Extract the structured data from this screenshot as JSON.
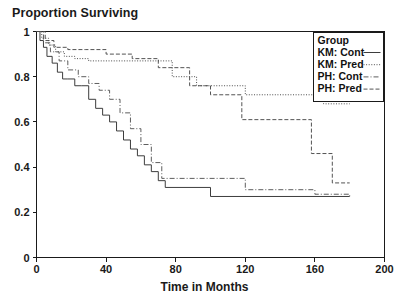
{
  "chart_data": {
    "type": "line",
    "title": "Proportion Surviving",
    "xlabel": "Time in Months",
    "ylabel": "",
    "xlim": [
      0,
      200
    ],
    "ylim": [
      0,
      1
    ],
    "xticks": [
      0,
      40,
      80,
      120,
      160,
      200
    ],
    "yticks": [
      0,
      0.2,
      0.4,
      0.6,
      0.8,
      1
    ],
    "xticklabels": [
      "0",
      "40",
      "80",
      "120",
      "160",
      "200"
    ],
    "yticklabels": [
      "0",
      "0.2",
      "0.4",
      "0.6",
      "0.8",
      "1"
    ],
    "grid": false,
    "step_style": "post",
    "legend_position": "top-right",
    "legend_title": "Group",
    "series": [
      {
        "name": "KM: Cont",
        "dash": "solid",
        "color": "#333333",
        "x": [
          0,
          2,
          4,
          6,
          9,
          12,
          15,
          18,
          22,
          26,
          30,
          34,
          38,
          42,
          46,
          50,
          54,
          58,
          62,
          66,
          70,
          74,
          100,
          180
        ],
        "y": [
          1.0,
          0.96,
          0.93,
          0.89,
          0.86,
          0.82,
          0.79,
          0.79,
          0.76,
          0.76,
          0.7,
          0.66,
          0.63,
          0.6,
          0.56,
          0.52,
          0.48,
          0.45,
          0.41,
          0.38,
          0.34,
          0.31,
          0.27,
          0.27
        ]
      },
      {
        "name": "KM: Pred",
        "dash": "dotted",
        "color": "#444444",
        "x": [
          0,
          3,
          7,
          11,
          16,
          22,
          30,
          45,
          60,
          78,
          92,
          120,
          150,
          165,
          180
        ],
        "y": [
          1.0,
          0.97,
          0.94,
          0.91,
          0.89,
          0.88,
          0.87,
          0.87,
          0.87,
          0.8,
          0.76,
          0.72,
          0.72,
          0.68,
          0.68
        ]
      },
      {
        "name": "PH: Cont",
        "dash": "dashdot",
        "color": "#555555",
        "x": [
          0,
          4,
          8,
          13,
          18,
          24,
          30,
          36,
          42,
          48,
          54,
          60,
          66,
          72,
          120,
          160,
          180
        ],
        "y": [
          1.0,
          0.95,
          0.91,
          0.87,
          0.83,
          0.8,
          0.77,
          0.74,
          0.7,
          0.64,
          0.57,
          0.5,
          0.42,
          0.35,
          0.3,
          0.28,
          0.27
        ]
      },
      {
        "name": "PH: Pred",
        "dash": "dashed",
        "color": "#4a4a4a",
        "x": [
          0,
          5,
          10,
          18,
          28,
          40,
          55,
          70,
          88,
          100,
          118,
          132,
          145,
          158,
          170,
          180
        ],
        "y": [
          1.0,
          0.96,
          0.93,
          0.92,
          0.92,
          0.9,
          0.88,
          0.84,
          0.76,
          0.72,
          0.61,
          0.61,
          0.61,
          0.46,
          0.33,
          0.33
        ]
      }
    ]
  },
  "legend": {
    "title": "Group",
    "entries": [
      {
        "label": "KM: Cont",
        "dash": "solid"
      },
      {
        "label": "KM: Pred",
        "dash": "dotted"
      },
      {
        "label": "PH: Cont",
        "dash": "dashdot"
      },
      {
        "label": "PH: Pred",
        "dash": "dashed"
      }
    ]
  }
}
